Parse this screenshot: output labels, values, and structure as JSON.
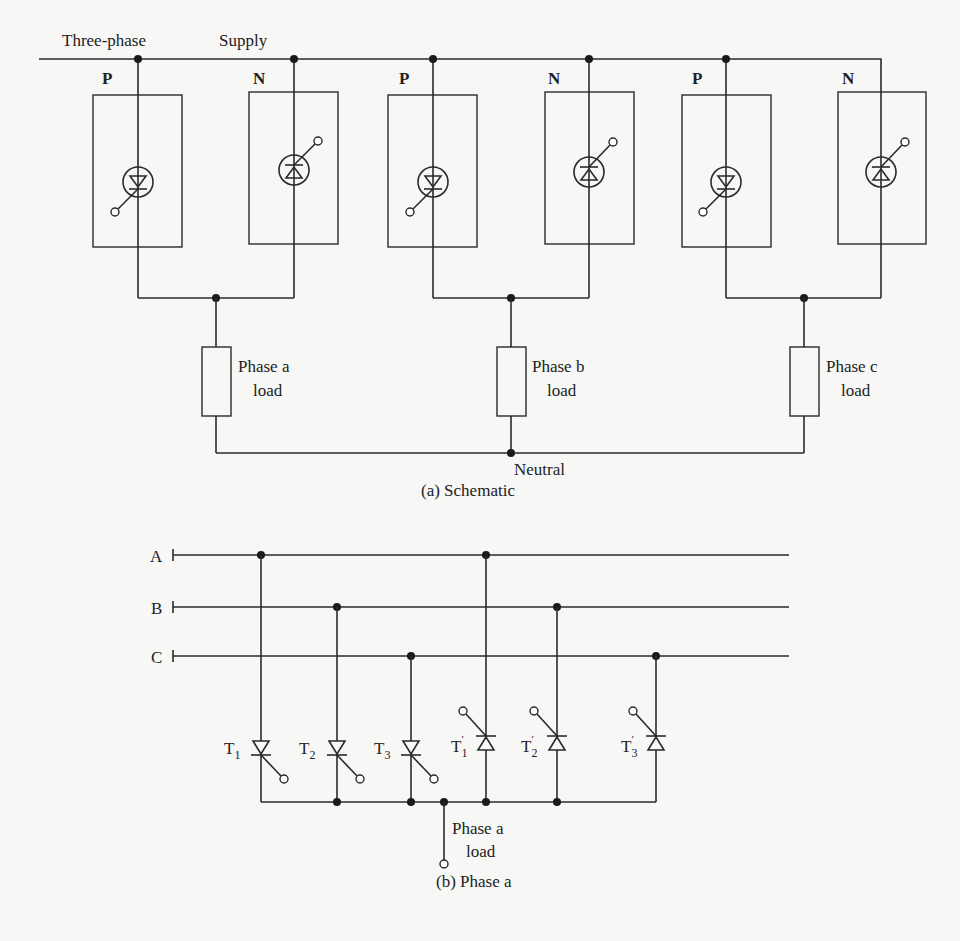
{
  "figure": {
    "schematic": {
      "supply_labels": [
        "Three-phase",
        "Supply"
      ],
      "caption": "(a) Schematic",
      "neutral_label": "Neutral",
      "phases": [
        {
          "id": "a",
          "p_label": "P",
          "n_label": "N",
          "load_line1": "Phase a",
          "load_line2": "load"
        },
        {
          "id": "b",
          "p_label": "P",
          "n_label": "N",
          "load_line1": "Phase b",
          "load_line2": "load"
        },
        {
          "id": "c",
          "p_label": "P",
          "n_label": "N",
          "load_line1": "Phase c",
          "load_line2": "load"
        }
      ]
    },
    "phase_a_detail": {
      "caption": "(b) Phase a",
      "buses": [
        "A",
        "B",
        "C"
      ],
      "thyristors": [
        {
          "label": "T",
          "sub": "1",
          "prime": false
        },
        {
          "label": "T",
          "sub": "2",
          "prime": false
        },
        {
          "label": "T",
          "sub": "3",
          "prime": false
        },
        {
          "label": "T",
          "sub": "1",
          "prime": true
        },
        {
          "label": "T",
          "sub": "2",
          "prime": true
        },
        {
          "label": "T",
          "sub": "3",
          "prime": true
        }
      ],
      "load_line1": "Phase a",
      "load_line2": "load",
      "prime_mark": "′"
    },
    "colors": {
      "background": "#f7f7f5",
      "ink": "#2a2a2a"
    }
  }
}
